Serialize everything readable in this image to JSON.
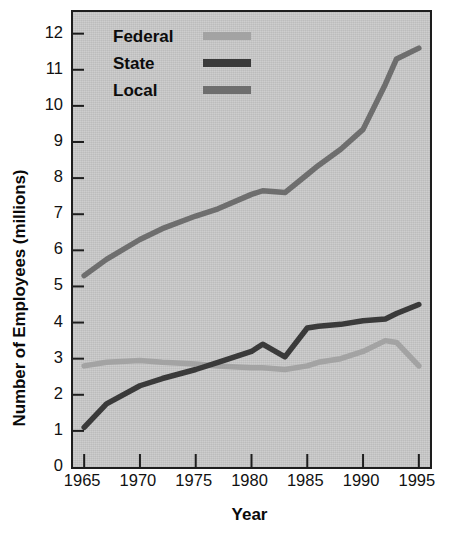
{
  "chart_data": {
    "type": "line",
    "title": "",
    "xlabel": "Year",
    "ylabel": "Number of Employees (millions)",
    "xlim": [
      1964,
      1996
    ],
    "ylim": [
      0,
      12.6
    ],
    "xticks": [
      1965,
      1970,
      1975,
      1980,
      1985,
      1990,
      1995
    ],
    "xtick_labels": [
      "1965",
      "1970",
      "1975",
      "1980",
      "1985",
      "1990",
      "1995"
    ],
    "yticks": [
      0,
      1,
      2,
      3,
      4,
      5,
      6,
      7,
      8,
      9,
      10,
      11,
      12
    ],
    "ytick_labels": [
      "0",
      "1",
      "2",
      "3",
      "4",
      "5",
      "6",
      "7",
      "8",
      "9",
      "10",
      "11",
      "12"
    ],
    "grid": false,
    "legend_position": "top-left",
    "x": [
      1965,
      1967,
      1970,
      1972,
      1975,
      1977,
      1980,
      1981,
      1983,
      1985,
      1986,
      1988,
      1990,
      1992,
      1993,
      1995
    ],
    "series": [
      {
        "name": "Federal",
        "color": "#a3a3a3",
        "values": [
          2.8,
          2.9,
          2.95,
          2.9,
          2.85,
          2.8,
          2.75,
          2.75,
          2.7,
          2.8,
          2.9,
          3.0,
          3.2,
          3.5,
          3.45,
          2.8
        ]
      },
      {
        "name": "State",
        "color": "#3a3a3a",
        "values": [
          1.1,
          1.75,
          2.25,
          2.45,
          2.7,
          2.9,
          3.2,
          3.4,
          3.05,
          3.85,
          3.9,
          3.95,
          4.05,
          4.1,
          4.25,
          4.5
        ]
      },
      {
        "name": "Local",
        "color": "#6e6e6e",
        "values": [
          5.3,
          5.75,
          6.3,
          6.6,
          6.95,
          7.15,
          7.55,
          7.65,
          7.6,
          8.1,
          8.35,
          8.8,
          9.35,
          10.6,
          11.3,
          11.6
        ]
      }
    ]
  },
  "legend": {
    "items": [
      {
        "label": "Federal",
        "color": "#a3a3a3"
      },
      {
        "label": "State",
        "color": "#3a3a3a"
      },
      {
        "label": "Local",
        "color": "#6e6e6e"
      }
    ]
  },
  "axes": {
    "x_title": "Year",
    "y_title": "Number of Employees (millions)"
  }
}
